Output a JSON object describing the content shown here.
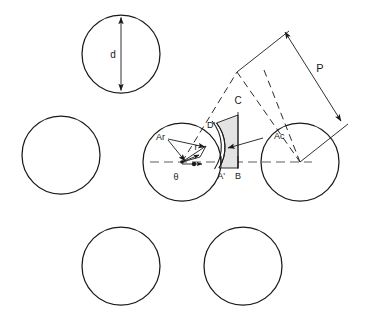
{
  "diagram": {
    "background_color": "#ffffff",
    "stroke_color": "#1a1a1a",
    "shade_color": "#e3e3e3",
    "centerline_color": "#4a4a4a",
    "labels": {
      "diameter": "d",
      "pitch": "P",
      "chord": "C",
      "radial_area": "Ar",
      "contact_area": "Ac",
      "radius": "r",
      "theta": "θ",
      "d_prime": "D'",
      "a_prime": "A'",
      "b_point": "B"
    },
    "circles": [
      {
        "name": "top-circle",
        "cx": 121,
        "cy": 54,
        "r": 39
      },
      {
        "name": "left-circle",
        "cx": 61,
        "cy": 155,
        "r": 39
      },
      {
        "name": "center-circle",
        "cx": 182,
        "cy": 162,
        "r": 39
      },
      {
        "name": "right-circle",
        "cx": 300,
        "cy": 162,
        "r": 39
      },
      {
        "name": "bottom-left-circle",
        "cx": 121,
        "cy": 266,
        "r": 39
      },
      {
        "name": "bottom-right-circle",
        "cx": 243,
        "cy": 266,
        "r": 39
      }
    ]
  }
}
